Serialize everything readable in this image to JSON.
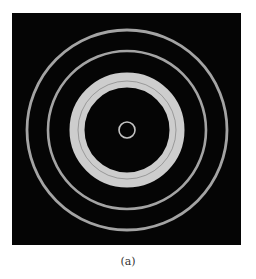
{
  "figure": {
    "background_color": "#050505",
    "ring_color": "#d8d8d8",
    "center": {
      "x": 115,
      "y": 117
    },
    "rings": [
      {
        "name": "center-ring",
        "r": 8,
        "width": 1.6,
        "opacity": 0.9
      },
      {
        "name": "thick-ring",
        "r": 50,
        "width": 15,
        "opacity": 0.95
      },
      {
        "name": "second-ring",
        "r": 79,
        "width": 2.6,
        "opacity": 0.75
      },
      {
        "name": "outer-ring",
        "r": 100,
        "width": 2.8,
        "opacity": 0.75
      }
    ],
    "thick_ring_dark_line_r": 49
  },
  "caption": "(a)"
}
